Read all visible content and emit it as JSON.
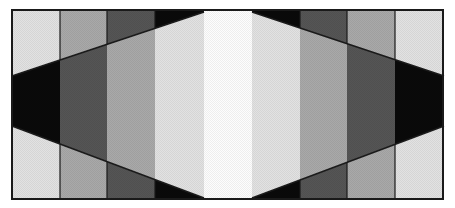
{
  "figure": {
    "frame": {
      "x": 12,
      "y": 10,
      "width": 431,
      "height": 189,
      "stroke": "#1a1a1a"
    },
    "columns_x": [
      12,
      60,
      107,
      155,
      204,
      252,
      300,
      347,
      395,
      443
    ],
    "colors": {
      "white": "#fdfdfd",
      "light": "#e2e2e2",
      "mid": "#a9a9a9",
      "dark": "#555555",
      "black": "#0a0a0a"
    },
    "left_half": {
      "top_band_columns": [
        "light",
        "mid",
        "dark",
        "black"
      ],
      "middle_band_columns": [
        "black",
        "dark",
        "mid",
        "light"
      ],
      "bottom_band_columns": [
        "light",
        "mid",
        "dark",
        "black"
      ]
    },
    "center_column": "white",
    "upper_diagonal": {
      "from": [
        12,
        76
      ],
      "to": [
        204,
        12
      ]
    },
    "lower_diagonal": {
      "from": [
        12,
        126
      ],
      "to": [
        204,
        198
      ]
    }
  }
}
